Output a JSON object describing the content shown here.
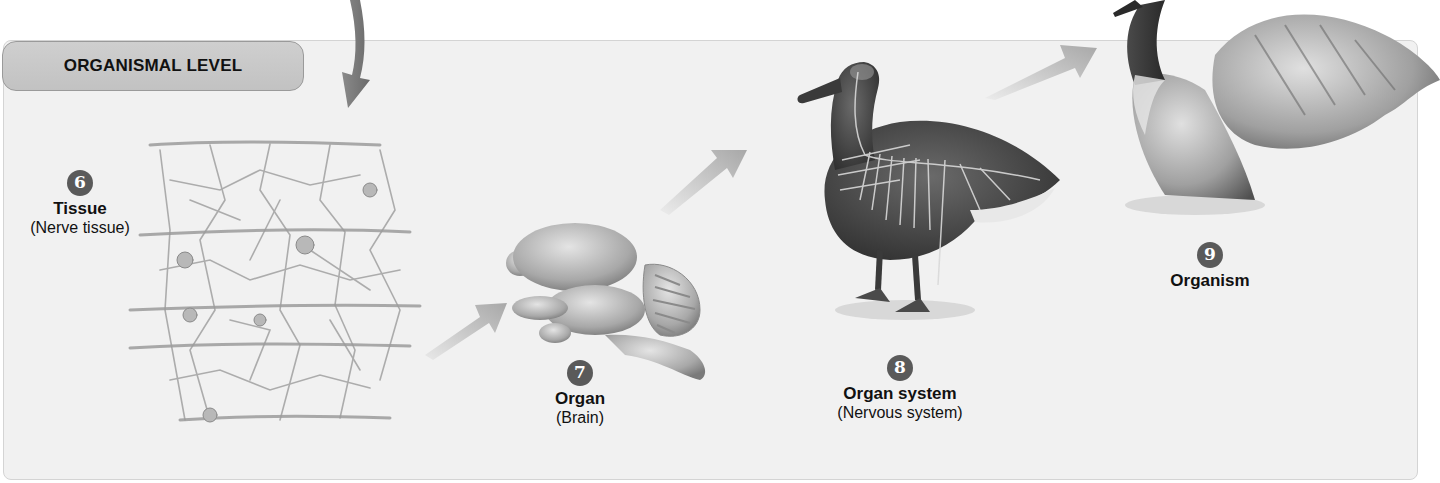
{
  "figure": {
    "level_label": "ORGANISMAL LEVEL",
    "colors": {
      "panel_bg": "#f1f1f1",
      "pill_bg": "#c8c8c8",
      "badge_bg": "#5a5a5a",
      "arrow": "#b5b5b5"
    },
    "stages": [
      {
        "number": "6",
        "title": "Tissue",
        "subtitle": "(Nerve tissue)",
        "illustration": "nerve-tissue-network"
      },
      {
        "number": "7",
        "title": "Organ",
        "subtitle": "(Brain)",
        "illustration": "brain"
      },
      {
        "number": "8",
        "title": "Organ system",
        "subtitle": "(Nervous system)",
        "illustration": "goose-with-nervous-system"
      },
      {
        "number": "9",
        "title": "Organism",
        "subtitle": "",
        "illustration": "goose-spreading-wings"
      }
    ],
    "arrows": [
      {
        "from": "previous-level",
        "to": "tissue",
        "shape": "curved-down"
      },
      {
        "from": "tissue",
        "to": "organ",
        "shape": "straight-diagonal"
      },
      {
        "from": "organ",
        "to": "organ-system",
        "shape": "straight-diagonal"
      },
      {
        "from": "organ-system",
        "to": "organism",
        "shape": "straight-diagonal"
      }
    ]
  }
}
